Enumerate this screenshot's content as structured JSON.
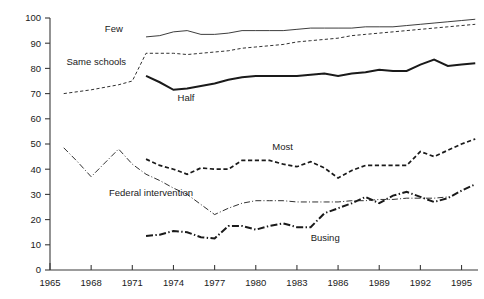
{
  "chart_data": {
    "type": "line",
    "title": "",
    "subtitle": "",
    "xlabel": "",
    "ylabel": "",
    "xlim": [
      1965,
      1996.2
    ],
    "ylim": [
      0,
      100
    ],
    "grid": false,
    "legend_position": "inline-annotations",
    "x_ticks": [
      1965,
      1968,
      1971,
      1974,
      1977,
      1980,
      1983,
      1986,
      1989,
      1992,
      1995
    ],
    "x_tick_labels": [
      "1965",
      "1968",
      "1971",
      "1974",
      "1977",
      "1980",
      "1983",
      "1986",
      "1989",
      "1992",
      "1995"
    ],
    "y_ticks": [
      0,
      10,
      20,
      30,
      40,
      50,
      60,
      70,
      80,
      90,
      100
    ],
    "y_tick_labels": [
      "0",
      "10",
      "20",
      "30",
      "40",
      "50",
      "60",
      "70",
      "80",
      "90",
      "100"
    ],
    "series": [
      {
        "name": "Few",
        "label": "Few",
        "style": "thin-solid",
        "color": "#1a1a1a",
        "label_x": 1969.0,
        "label_y": 94.5,
        "x": [
          1972,
          1973,
          1974,
          1975,
          1976,
          1977,
          1978,
          1979,
          1980,
          1981,
          1982,
          1983,
          1984,
          1985,
          1986,
          1987,
          1988,
          1989,
          1990,
          1991,
          1992,
          1993,
          1994,
          1995,
          1996
        ],
        "values": [
          92.5,
          93.0,
          94.5,
          95.0,
          93.5,
          93.5,
          94.0,
          95.0,
          95.0,
          95.0,
          95.0,
          95.5,
          96.0,
          96.0,
          96.0,
          96.0,
          96.5,
          96.5,
          96.5,
          97.0,
          97.5,
          98.0,
          98.5,
          99.0,
          99.5
        ]
      },
      {
        "name": "Same schools",
        "label": "Same schools",
        "style": "fine-dashed",
        "color": "#1a1a1a",
        "label_x": 1966.2,
        "label_y": 81.5,
        "x": [
          1966,
          1968,
          1970,
          1971,
          1972,
          1973,
          1974,
          1975,
          1976,
          1977,
          1978,
          1979,
          1980,
          1981,
          1982,
          1983,
          1984,
          1985,
          1986,
          1987,
          1988,
          1989,
          1990,
          1991,
          1992,
          1993,
          1994,
          1995,
          1996
        ],
        "values": [
          70.0,
          71.5,
          73.5,
          75.0,
          86.0,
          86.0,
          86.0,
          85.5,
          86.0,
          86.5,
          87.0,
          88.0,
          88.5,
          89.0,
          89.5,
          90.5,
          91.0,
          91.5,
          92.0,
          93.0,
          93.5,
          94.0,
          94.5,
          95.0,
          95.5,
          96.0,
          96.5,
          97.0,
          97.5
        ]
      },
      {
        "name": "Half",
        "label": "Half",
        "style": "thick-solid",
        "color": "#1a1a1a",
        "label_x": 1974.3,
        "label_y": 67.0,
        "x": [
          1972,
          1973,
          1974,
          1975,
          1976,
          1977,
          1978,
          1979,
          1980,
          1981,
          1982,
          1983,
          1984,
          1985,
          1986,
          1987,
          1988,
          1989,
          1990,
          1991,
          1992,
          1993,
          1994,
          1995,
          1996
        ],
        "values": [
          77.0,
          74.5,
          71.5,
          72.0,
          73.0,
          74.0,
          75.5,
          76.5,
          77.0,
          77.0,
          77.0,
          77.0,
          77.5,
          78.0,
          77.0,
          78.0,
          78.5,
          79.5,
          79.0,
          79.0,
          81.5,
          83.5,
          81.0,
          81.5,
          82.0
        ]
      },
      {
        "name": "Most",
        "label": "Most",
        "style": "medium-dashed",
        "color": "#1a1a1a",
        "label_x": 1981.2,
        "label_y": 47.5,
        "x": [
          1972,
          1973,
          1974,
          1975,
          1976,
          1977,
          1978,
          1979,
          1980,
          1981,
          1982,
          1983,
          1984,
          1985,
          1986,
          1987,
          1988,
          1989,
          1990,
          1991,
          1992,
          1993,
          1994,
          1995,
          1996
        ],
        "values": [
          44.0,
          41.5,
          40.0,
          38.0,
          40.5,
          40.0,
          40.0,
          43.5,
          43.5,
          43.5,
          42.0,
          41.0,
          43.0,
          40.5,
          36.5,
          39.5,
          41.5,
          41.5,
          41.5,
          41.5,
          47.0,
          45.0,
          47.5,
          50.0,
          52.0
        ]
      },
      {
        "name": "Federal intervention",
        "label": "Federal intervention",
        "style": "fine-dash-dot",
        "color": "#1a1a1a",
        "label_x": 1969.3,
        "label_y": 29.5,
        "x": [
          1966,
          1967,
          1968,
          1969,
          1970,
          1971,
          1972,
          1973,
          1974,
          1975,
          1976,
          1977,
          1978,
          1979,
          1980,
          1981,
          1982,
          1983,
          1984,
          1985,
          1986,
          1987,
          1988,
          1989,
          1990,
          1991,
          1992,
          1993,
          1994
        ],
        "values": [
          48.5,
          43.0,
          37.0,
          42.5,
          48.0,
          42.0,
          38.0,
          35.5,
          32.5,
          30.0,
          26.0,
          22.0,
          24.5,
          26.5,
          27.5,
          27.5,
          27.5,
          27.0,
          27.0,
          27.0,
          27.0,
          27.5,
          27.5,
          28.0,
          28.0,
          28.5,
          28.5,
          28.5,
          29.0
        ]
      },
      {
        "name": "Busing",
        "label": "Busing",
        "style": "thick-dash-dot",
        "color": "#1a1a1a",
        "label_x": 1984.0,
        "label_y": 11.5,
        "x": [
          1972,
          1973,
          1974,
          1975,
          1976,
          1977,
          1978,
          1979,
          1980,
          1981,
          1982,
          1983,
          1984,
          1985,
          1986,
          1987,
          1988,
          1989,
          1990,
          1991,
          1992,
          1993,
          1994,
          1995,
          1996
        ],
        "values": [
          13.5,
          14.0,
          15.5,
          15.0,
          13.0,
          12.5,
          17.5,
          17.5,
          16.0,
          17.5,
          18.5,
          17.0,
          17.0,
          22.5,
          24.5,
          26.5,
          29.0,
          26.5,
          29.5,
          31.0,
          29.0,
          27.0,
          28.5,
          31.5,
          34.0
        ]
      }
    ]
  }
}
